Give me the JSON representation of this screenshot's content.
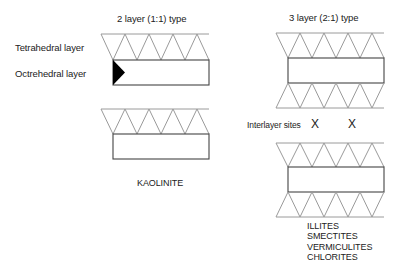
{
  "left_panel": {
    "heading": "2 layer (1:1) type",
    "labels": {
      "tetrahedral": "Tetrahedral layer",
      "octahedral": "Octrehedral layer"
    },
    "mineral": "KAOLINITE"
  },
  "right_panel": {
    "heading": "3 layer (2:1) type",
    "interlayer_label": "Interlayer sites",
    "interlayer_marks": [
      "X",
      "X"
    ],
    "minerals": [
      "ILLITES",
      "SMECTITES",
      "VERMICULITES",
      "CHLORITES"
    ]
  },
  "colors": {
    "tetrahedral_stroke": "#9a9a9a",
    "octahedral_stroke": "#444444",
    "text": "#222222"
  }
}
